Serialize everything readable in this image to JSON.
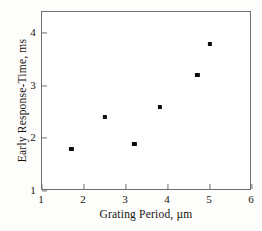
{
  "chart_data": {
    "type": "scatter",
    "title": "",
    "subtitle": "",
    "xlabel": "Grating Period, µm",
    "ylabel": "Early Response-Time, ms",
    "xlim": [
      1,
      6
    ],
    "ylim": [
      1,
      4.4
    ],
    "xticks": [
      1,
      2,
      3,
      4,
      5,
      6
    ],
    "yticks": [
      1,
      2,
      3,
      4
    ],
    "xticklabels": [
      "1",
      "2",
      "3",
      "4",
      "5",
      "6"
    ],
    "yticklabels": [
      "1",
      "2",
      "3",
      "4"
    ],
    "grid": false,
    "legend": false,
    "legend_position": "none",
    "marker": "square",
    "marker_color": "#0d0d0d",
    "frame_color": "#6e6e6e",
    "background_color": "#fdfdfb",
    "plot_background_color": "#ffffff",
    "series": [
      {
        "name": "Early response time vs grating period",
        "x": [
          1.7,
          2.5,
          3.2,
          3.8,
          4.7,
          5.0
        ],
        "y": [
          1.8,
          2.4,
          1.9,
          2.6,
          3.2,
          3.8
        ]
      }
    ],
    "points": [
      {
        "x": 1.7,
        "y": 1.8
      },
      {
        "x": 2.5,
        "y": 2.4
      },
      {
        "x": 3.2,
        "y": 1.9
      },
      {
        "x": 3.8,
        "y": 2.6
      },
      {
        "x": 4.7,
        "y": 3.2
      },
      {
        "x": 5.0,
        "y": 3.8
      }
    ],
    "annotations": []
  }
}
